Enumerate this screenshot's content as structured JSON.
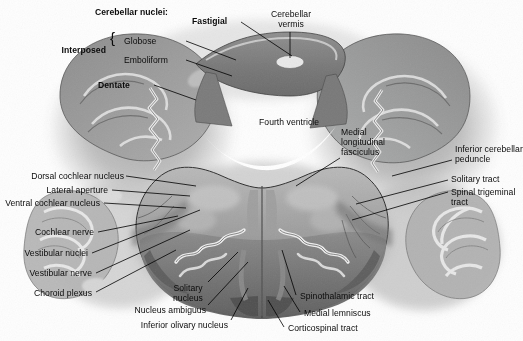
{
  "figure": {
    "kind": "anatomical-cross-section",
    "background_color": "#fefefe",
    "ink_color": "#0b0b0b"
  },
  "labels": {
    "cerebellar_nuclei_heading": "Cerebellar nuclei:",
    "fastigial": "Fastigial",
    "interposed": "Interposed",
    "globose": "Globose",
    "emboliform": "Emboliform",
    "dentate": "Dentate",
    "cerebellar_vermis": "Cerebellar\nvermis",
    "fourth_ventricle": "Fourth ventricle",
    "medial_longitudinal_fasciculus": "Medial\nlongitudinal\nfasciculus",
    "inferior_cerebellar_peduncle": "Inferior cerebellar\npeduncle",
    "solitary_tract": "Solitary tract",
    "spinal_trigeminal_tract": "Spinal trigeminal\ntract",
    "dorsal_cochlear_nucleus": "Dorsal cochlear nucleus",
    "lateral_aperture": "Lateral aperture",
    "ventral_cochlear_nucleus": "Ventral cochlear nucleus",
    "cochlear_nerve": "Cochlear nerve",
    "vestibular_nuclei": "Vestibular nuclei",
    "vestibular_nerve": "Vestibular nerve",
    "choroid_plexus": "Choroid plexus",
    "solitary_nucleus": "Solitary\nnucleus",
    "nucleus_ambiguus": "Nucleus ambiguus",
    "inferior_olivary_nucleus": "Inferior olivary nucleus",
    "spinothalamic_tract": "Spinothalamic tract",
    "medial_lemniscus": "Medial lemniscus",
    "corticospinal_tract": "Corticospinal tract",
    "brace_interposed": "{"
  }
}
